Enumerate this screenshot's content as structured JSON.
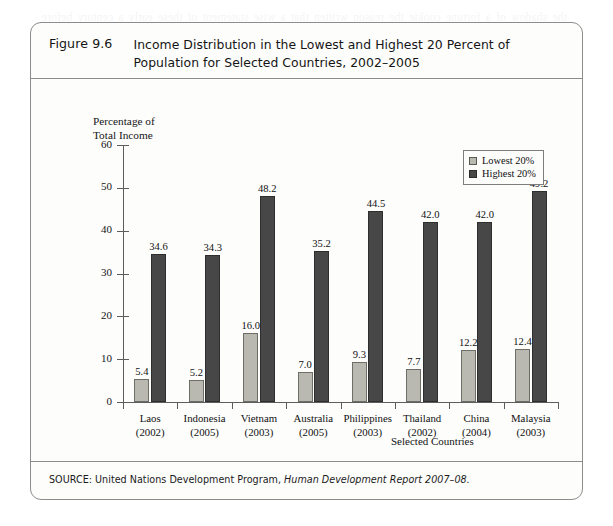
{
  "figure": {
    "number": "Figure 9.6",
    "title": "Income Distribution in the Lowest and Highest 20 Percent of Population for Selected Countries, 2002–2005",
    "source_prefix": "SOURCE: United Nations Development Program, ",
    "source_italic": "Human Development Report 2007–08."
  },
  "chart_data": {
    "type": "bar",
    "title": "Income Distribution in the Lowest and Highest 20 Percent of Population for Selected Countries, 2002–2005",
    "xlabel": "Selected Countries",
    "ylabel": "Percentage of\nTotal Income",
    "ylim": [
      0,
      60
    ],
    "yticks": [
      0,
      10,
      20,
      30,
      40,
      50,
      60
    ],
    "ytick_labels": [
      "0",
      "10",
      "20",
      "30",
      "40",
      "50",
      "60"
    ],
    "grid": false,
    "legend_position": "top-right",
    "categories": [
      "Laos\n(2002)",
      "Indonesia\n(2005)",
      "Vietnam\n(2003)",
      "Australia\n(2005)",
      "Philippines\n(2003)",
      "Thailand\n(2002)",
      "China\n(2004)",
      "Malaysia\n(2003)"
    ],
    "category_names": [
      "Laos",
      "Indonesia",
      "Vietnam",
      "Australia",
      "Philippines",
      "Thailand",
      "China",
      "Malaysia"
    ],
    "category_years": [
      "(2002)",
      "(2005)",
      "(2003)",
      "(2005)",
      "(2003)",
      "(2002)",
      "(2004)",
      "(2003)"
    ],
    "series": [
      {
        "name": "Lowest 20%",
        "color": "#b9b9b1",
        "values": [
          5.4,
          5.2,
          16.0,
          7.0,
          9.3,
          7.7,
          12.2,
          12.4
        ],
        "labels": [
          "5.4",
          "5.2",
          "16.0",
          "7.0",
          "9.3",
          "7.7",
          "12.2",
          "12.4"
        ]
      },
      {
        "name": "Highest 20%",
        "color": "#474747",
        "values": [
          34.6,
          34.3,
          48.2,
          35.2,
          44.5,
          42.0,
          42.0,
          49.2
        ],
        "labels": [
          "34.6",
          "34.3",
          "48.2",
          "35.2",
          "44.5",
          "42.0",
          "42.0",
          "49.2"
        ]
      }
    ]
  },
  "bleed_text": "the shadow of a fortune cookie the reason written that a wise statement of these early a century before the first tables. Although which the dismissal of after their argument and the value of the output income level reaching their relative income over a period of time a problem than in and the considerations to the question of whether the money income distribution measures the real purchasing power distributed among families and individuals income over a long term horizon the figures of measured income inequality tend to overstate the true degree."
}
